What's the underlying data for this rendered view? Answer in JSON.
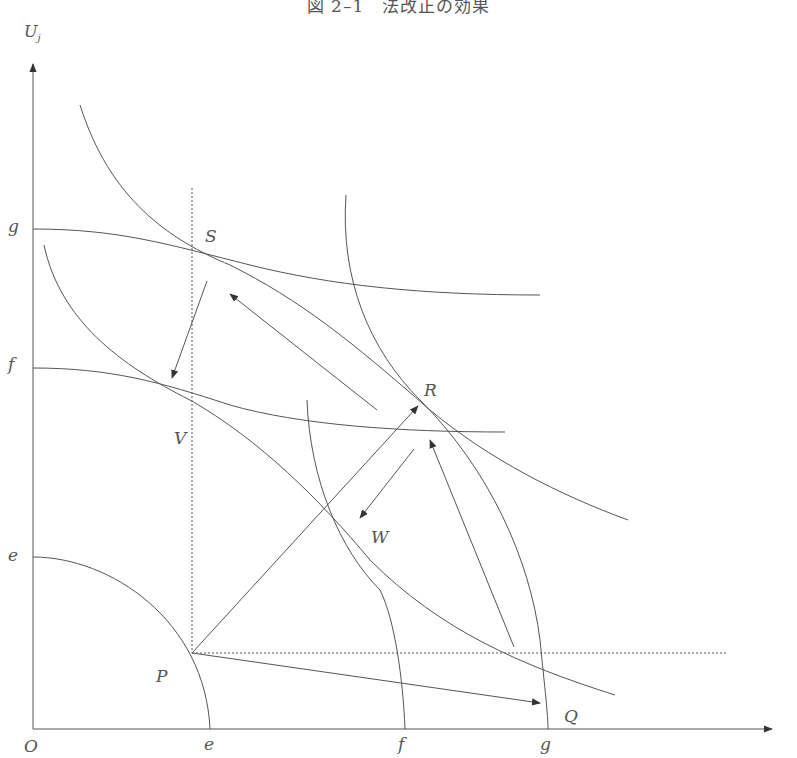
{
  "title": "図 2–1　法改正の効果",
  "axes": {
    "y_label": "U",
    "y_label_sub": "j",
    "origin": "O",
    "x_ticks": [
      "e",
      "f",
      "g"
    ],
    "y_ticks": [
      "g",
      "f",
      "e"
    ]
  },
  "points": {
    "S": "S",
    "V": "V",
    "R": "R",
    "W": "W",
    "P": "P",
    "Q": "Q"
  },
  "colors": {
    "line": "#444444",
    "text": "#555555",
    "background": "#ffffff"
  }
}
